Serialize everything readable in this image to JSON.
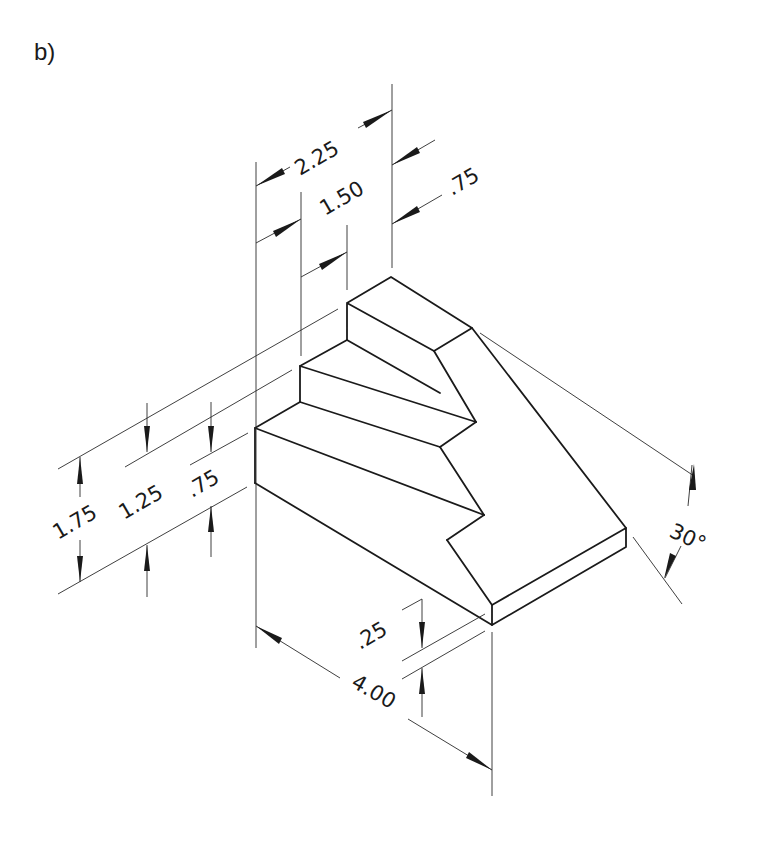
{
  "figure": {
    "label": "b)",
    "type": "isometric stepped block drawing",
    "line_color": "#1a1a1a",
    "background": "#ffffff"
  },
  "dimensions": {
    "top_overall_width": "2.25",
    "top_step_width": "1.50",
    "top_block_depth": ".75",
    "height_overall": "1.75",
    "height_middle": "1.25",
    "height_lower": ".75",
    "base_thickness": ".25",
    "overall_length": "4.00",
    "slope_angle": "30°"
  }
}
